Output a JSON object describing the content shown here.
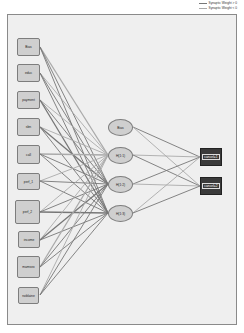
{
  "legend": {
    "positive": {
      "label": "Synaptic Weight > 0",
      "color": "#777777"
    },
    "negative": {
      "label": "Synaptic Weight < 0",
      "color": "#aaaaaa"
    }
  },
  "input_layer": {
    "nodes": [
      {
        "label": "Bias"
      },
      {
        "label": "educ"
      },
      {
        "label": "payment"
      },
      {
        "label": "sbn"
      },
      {
        "label": "call"
      },
      {
        "label": "perf_1"
      },
      {
        "label": "perf_2"
      },
      {
        "label": "income"
      },
      {
        "label": "mamsex"
      },
      {
        "label": "noblaine"
      }
    ]
  },
  "hidden_layer": {
    "nodes": [
      {
        "label": "Bias"
      },
      {
        "label": "H(1:1)"
      },
      {
        "label": "H(1:2)"
      },
      {
        "label": "H(1:3)"
      }
    ]
  },
  "output_layer": {
    "nodes": [
      {
        "label": "cancel=1"
      },
      {
        "label": "cancel=2"
      }
    ]
  }
}
